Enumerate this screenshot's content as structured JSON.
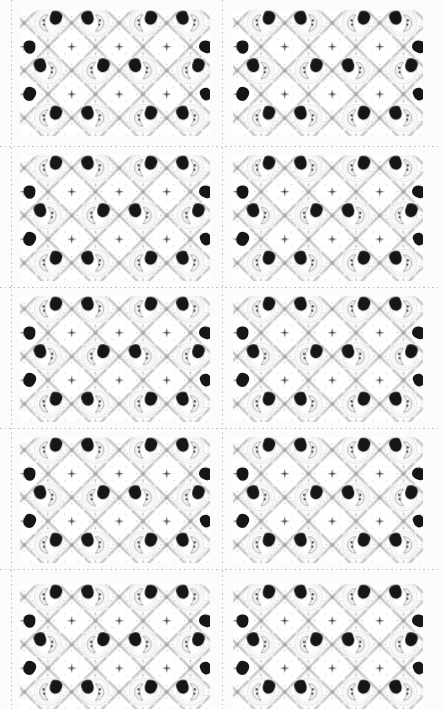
{
  "document": {
    "type": "printable-card-sheet",
    "page_background_color": "#fbfbfb"
  },
  "sheet": {
    "columns": 2,
    "rows": 5,
    "card_count": 10,
    "card_width": 190,
    "card_height": 126,
    "column_x": [
      20,
      233
    ],
    "row_y": [
      10,
      155,
      296,
      437,
      584
    ],
    "cut_lines": {
      "style": "dashed",
      "color": "#c2c2c2",
      "vertical_x": [
        11,
        222
      ],
      "horizontal_y": [
        146,
        287,
        428,
        569
      ]
    }
  },
  "card_pattern": {
    "description": "vintage moon-face damask trellis lattice with dark ink blobs",
    "background_color": "#fefefe",
    "line_ink_color": "#9c9c9c",
    "chain_ink_color": "#b3b3b3",
    "blob_ink_color": "#161616",
    "star_ink_color": "#4d4d4d",
    "cell_size": 47.5,
    "medallion_columns": 4,
    "medallion_rows": 3,
    "medallions_per_card": 12,
    "stars_per_card": 6,
    "lattice_crosses_per_card": 20,
    "edge_blobs_per_card": 4,
    "edge_blob_positions": [
      {
        "x": 10,
        "y": 37,
        "rot": -8,
        "scale": 0.95
      },
      {
        "x": 186,
        "y": 37,
        "rot": 100,
        "scale": 1.0
      },
      {
        "x": 10,
        "y": 84,
        "rot": 14,
        "scale": 1.0
      },
      {
        "x": 186,
        "y": 84,
        "rot": -30,
        "scale": 0.9
      }
    ],
    "motifs": [
      "moon-medallion",
      "ink-blob",
      "lattice-cross",
      "sparkle-star",
      "dotted-chain"
    ]
  }
}
